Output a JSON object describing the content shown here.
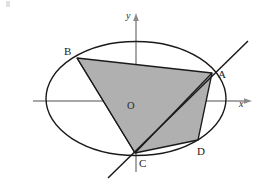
{
  "figure": {
    "type": "geometry-diagram",
    "canvas": {
      "width": 258,
      "height": 191,
      "background": "#ffffff"
    },
    "axes": {
      "x_label": "x",
      "y_label": "y",
      "origin_label": "O",
      "color": "#8a8a8a",
      "x_start": [
        33,
        101
      ],
      "x_end": [
        250,
        101
      ],
      "y_start": [
        136,
        172
      ],
      "y_end": [
        136,
        15
      ],
      "origin": [
        136,
        101
      ],
      "origin_label_pos": [
        127,
        109
      ],
      "x_label_pos": [
        239,
        107
      ],
      "y_label_pos": [
        126,
        17
      ]
    },
    "ellipse": {
      "center": [
        136,
        98.5
      ],
      "rx": 90,
      "ry": 57,
      "stroke": "#1a1a1a",
      "stroke_width": 1.4,
      "fill": "none"
    },
    "secant_line": {
      "name": "line-through-C-and-A",
      "from": [
        108,
        178
      ],
      "to": [
        248,
        41
      ],
      "stroke": "#1a1a1a",
      "stroke_width": 1.5
    },
    "shaded_region": {
      "name": "quadrilateral-ABCD",
      "fill": "#b0b0b0",
      "stroke": "#1a1a1a",
      "stroke_width": 1.3,
      "vertices": [
        {
          "id": "B",
          "x": 77,
          "y": 58
        },
        {
          "id": "A",
          "x": 212,
          "y": 73
        },
        {
          "id": "D",
          "x": 198,
          "y": 140
        },
        {
          "id": "C",
          "x": 135,
          "y": 153
        }
      ],
      "path": "M 77 58 L 212 73 L 198 140 L 135 153 Z"
    },
    "internal_segments": [
      {
        "name": "segment-B-C",
        "from": [
          77,
          58
        ],
        "to": [
          135,
          153
        ]
      },
      {
        "name": "segment-C-A",
        "from": [
          135,
          153
        ],
        "to": [
          212,
          73
        ]
      }
    ],
    "points": [
      {
        "id": "A",
        "label": "A",
        "x": 212,
        "y": 73,
        "label_x": 218,
        "label_y": 78
      },
      {
        "id": "B",
        "label": "B",
        "x": 77,
        "y": 58,
        "label_x": 64,
        "label_y": 55
      },
      {
        "id": "C",
        "label": "C",
        "x": 135,
        "y": 153,
        "label_x": 139,
        "label_y": 167
      },
      {
        "id": "D",
        "label": "D",
        "x": 198,
        "y": 140,
        "label_x": 197,
        "label_y": 155
      }
    ]
  }
}
